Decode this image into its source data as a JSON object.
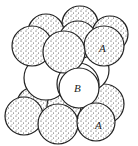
{
  "diagram": {
    "type": "sphere-packing",
    "colors": {
      "outline": "#222222",
      "stipple": "#333333",
      "b_fill": "#ffffff",
      "a_fill": "#ffffff"
    },
    "labels": {
      "top_a": "A",
      "middle_b": "B",
      "bottom_a": "A"
    },
    "layers": [
      {
        "name": "top-A-layer",
        "style": "stippled",
        "sphere_count": 7
      },
      {
        "name": "middle-B-layer",
        "style": "plain",
        "sphere_count": 3
      },
      {
        "name": "bottom-A-layer",
        "style": "stippled",
        "sphere_count": 7
      }
    ]
  }
}
